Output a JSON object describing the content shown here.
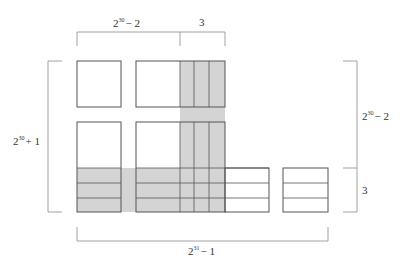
{
  "diagram": {
    "type": "area-decomposition",
    "colors": {
      "shade": "#d4d4d4",
      "stroke": "#555555",
      "bracket": "#8a8a8a",
      "text": "#333333"
    },
    "labels": {
      "top_left": {
        "base": "2",
        "exp": "30",
        "tail": "− 2"
      },
      "top_right": {
        "text": "3"
      },
      "left": {
        "base": "2",
        "exp": "30",
        "tail": "+ 1"
      },
      "right_top": {
        "base": "2",
        "exp": "30",
        "tail": "− 2"
      },
      "right_bottom": {
        "text": "3"
      },
      "bottom": {
        "base": "2",
        "exp": "31",
        "tail": "− 1"
      }
    }
  }
}
